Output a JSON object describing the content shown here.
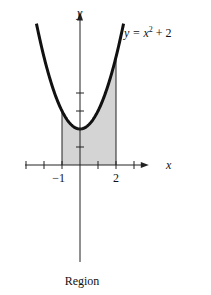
{
  "chart_data": {
    "type": "area",
    "title": "",
    "function_label": "y = x² + 2",
    "function_label_parts": {
      "lhs": "y = x",
      "exp": "2",
      "rhs": " + 2"
    },
    "xlabel": "x",
    "ylabel": "y",
    "caption": "Region",
    "xlim": [
      -3,
      3.6
    ],
    "ylim": [
      -6.5,
      8.3
    ],
    "x_ticks": [
      -3,
      -2,
      -1,
      1,
      2,
      3
    ],
    "y_ticks": [
      1,
      2,
      3,
      4
    ],
    "x_tick_labels": [
      {
        "value": -1,
        "label": "−1"
      },
      {
        "value": 2,
        "label": "2"
      }
    ],
    "curve": {
      "expression": "x^2 + 2",
      "domain": [
        -2.42,
        2.42
      ]
    },
    "shaded_region": {
      "from": -1,
      "to": 2,
      "below": "curve",
      "above": "x-axis",
      "color": "#d4d4d4"
    },
    "grid": false,
    "legend": "none"
  }
}
